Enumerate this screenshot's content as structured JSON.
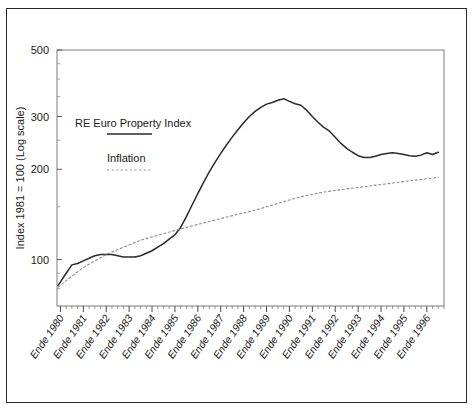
{
  "chart_data": {
    "type": "line",
    "title": "",
    "xlabel": "",
    "ylabel": "Index 1981 = 100 (Log scale)",
    "yscale": "log",
    "ylim": [
      70,
      500
    ],
    "ytick_labels": [
      "500",
      "300",
      "200",
      "100"
    ],
    "ytick_values": [
      500,
      300,
      200,
      100
    ],
    "grid": false,
    "legend_position": "inside-upper-left",
    "x_tick_labels": [
      "Ende 1980",
      "Ende 1981",
      "Ende 1982",
      "Ende 1983",
      "Ende 1984",
      "Ende 1985",
      "Ende 1986",
      "Ende 1987",
      "Ende 1988",
      "Ende 1989",
      "Ende 1990",
      "Ende 1991",
      "Ende 1992",
      "Ende 1993",
      "Ende 1994",
      "Ende 1995",
      "Ende 1996"
    ],
    "x_major_values": [
      1980,
      1981,
      1982,
      1983,
      1984,
      1985,
      1986,
      1987,
      1988,
      1989,
      1990,
      1991,
      1992,
      1993,
      1994,
      1995,
      1996
    ],
    "xlim": [
      1979.85,
      1996.75
    ],
    "minor_ticks_per_major": 3,
    "series": [
      {
        "name": "RE Euro Property Index",
        "style": "solid",
        "color": "#2b2b2b",
        "x": [
          1979.9,
          1980.25,
          1980.5,
          1980.75,
          1981.0,
          1981.25,
          1981.5,
          1981.75,
          1982.0,
          1982.25,
          1982.5,
          1982.75,
          1983.0,
          1983.25,
          1983.5,
          1983.75,
          1984.0,
          1984.25,
          1984.5,
          1984.75,
          1985.0,
          1985.25,
          1985.5,
          1985.75,
          1986.0,
          1986.25,
          1986.5,
          1986.75,
          1987.0,
          1987.25,
          1987.5,
          1987.75,
          1988.0,
          1988.25,
          1988.5,
          1988.75,
          1989.0,
          1989.25,
          1989.5,
          1989.75,
          1990.0,
          1990.25,
          1990.5,
          1990.75,
          1991.0,
          1991.25,
          1991.5,
          1991.75,
          1992.0,
          1992.25,
          1992.5,
          1992.75,
          1993.0,
          1993.25,
          1993.5,
          1993.75,
          1994.0,
          1994.25,
          1994.5,
          1994.75,
          1995.0,
          1995.25,
          1995.5,
          1995.75,
          1996.0,
          1996.25,
          1996.5
        ],
        "values": [
          82,
          90,
          96,
          97,
          99,
          101,
          103,
          104,
          104,
          104,
          103,
          102,
          102,
          102,
          103,
          105,
          107,
          110,
          113,
          117,
          121,
          128,
          139,
          152,
          166,
          181,
          196,
          211,
          226,
          241,
          256,
          271,
          286,
          300,
          312,
          322,
          330,
          334,
          340,
          344,
          337,
          331,
          327,
          315,
          300,
          287,
          276,
          268,
          256,
          244,
          235,
          228,
          222,
          219,
          219,
          221,
          224,
          226,
          227,
          226,
          224,
          222,
          221,
          223,
          227,
          224,
          228
        ]
      },
      {
        "name": "Inflation",
        "style": "dotted",
        "color": "#8a8a8a",
        "x": [
          1979.9,
          1980.5,
          1981.0,
          1981.5,
          1982.0,
          1982.5,
          1983.0,
          1983.5,
          1984.0,
          1984.5,
          1985.0,
          1985.5,
          1986.0,
          1986.5,
          1987.0,
          1987.5,
          1988.0,
          1988.5,
          1989.0,
          1989.5,
          1990.0,
          1990.5,
          1991.0,
          1991.5,
          1992.0,
          1992.5,
          1993.0,
          1993.5,
          1994.0,
          1994.5,
          1995.0,
          1995.5,
          1996.0,
          1996.5
        ],
        "values": [
          81,
          88,
          94,
          99,
          104,
          108,
          112,
          116,
          119,
          122,
          125,
          128,
          131,
          134,
          137,
          140,
          143,
          146,
          150,
          154,
          158,
          162,
          165,
          168,
          170,
          172,
          174,
          176,
          178,
          180,
          182,
          184,
          186,
          188
        ]
      }
    ],
    "legend_entries": [
      {
        "label": "RE Euro Property Index",
        "style": "solid"
      },
      {
        "label": "Inflation",
        "style": "dotted"
      }
    ]
  }
}
